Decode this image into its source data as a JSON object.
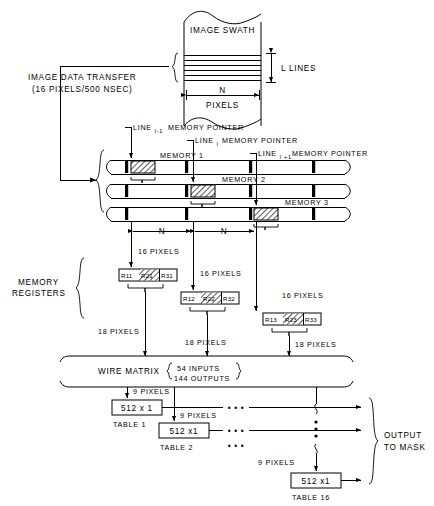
{
  "swath": {
    "label": "IMAGE SWATH",
    "lines_label": "L LINES",
    "width_label": "N",
    "width_unit_label": "PIXELS"
  },
  "transfer": {
    "line1": "IMAGE DATA TRANSFER",
    "line2": "(16 PIXELS/500 NSEC)"
  },
  "pointers": [
    {
      "prefix": "LINE",
      "sub": "I-1",
      "text": "MEMORY POINTER"
    },
    {
      "prefix": "LINE",
      "sub": "I",
      "text": "MEMORY POINTER"
    },
    {
      "prefix": "LINE",
      "sub": "I +1",
      "text": "MEMORY POINTER"
    }
  ],
  "memories": [
    {
      "label": "MEMORY 1"
    },
    {
      "label": "MEMORY 2"
    },
    {
      "label": "MEMORY 3"
    }
  ],
  "spans": {
    "n_left": "N",
    "n_right": "N"
  },
  "memory_registers": {
    "label_line1": "MEMORY",
    "label_line2": "REGISTERS"
  },
  "registers": [
    {
      "input_label": "16 PIXELS",
      "left": "R11",
      "middle": "R21",
      "right": "R31",
      "output_label": "18 PIXELS"
    },
    {
      "input_label": "16 PIXELS",
      "left": "R12",
      "middle": "R22",
      "right": "R32",
      "output_label": "18 PIXELS"
    },
    {
      "input_label": "16 PIXELS",
      "left": "R13",
      "middle": "R23",
      "right": "R33",
      "output_label": "18 PIXELS"
    }
  ],
  "wire_matrix": {
    "label": "WIRE MATRIX",
    "inputs": "54 INPUTS",
    "outputs": "144 OUTPUTS"
  },
  "tables": [
    {
      "pixels_label": "9 PIXELS",
      "box": "512 x 1",
      "name": "TABLE 1"
    },
    {
      "pixels_label": "9 PIXELS",
      "box": "512 x1",
      "name": "TABLE 2"
    },
    {
      "pixels_label": "9 PIXELS",
      "box": "512 x1",
      "name": "TABLE 16"
    }
  ],
  "output": {
    "line1": "OUTPUT",
    "line2": "TO MASK"
  },
  "ellipsis": {
    "horizontal": "• • •",
    "vertical": "•"
  },
  "colors": {
    "ink": "#000000",
    "paper": "#ffffff"
  }
}
